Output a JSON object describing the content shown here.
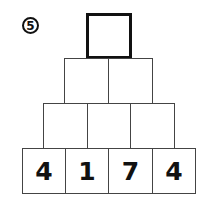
{
  "problem_number": "5",
  "pyramid": {
    "rows": [
      [
        "?"
      ],
      [
        "",
        ""
      ],
      [
        "",
        "",
        ""
      ],
      [
        "4",
        "1",
        "7",
        "4"
      ]
    ],
    "row_values_display": {
      "row0": [
        ""
      ],
      "row1": [
        "",
        ""
      ],
      "row2": [
        "",
        "",
        ""
      ],
      "row3": [
        "4",
        "1",
        "7",
        "4"
      ]
    }
  }
}
